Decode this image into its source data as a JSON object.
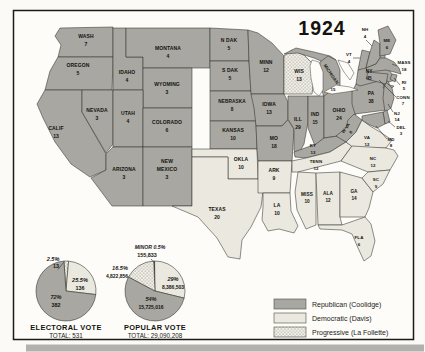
{
  "title": "1924",
  "colors": {
    "republican": "#a8a7a1",
    "democratic": "#eae8df",
    "progressive_bg": "#f3f1e8",
    "dot": "#45443f",
    "minor": "#1c1c1a",
    "frame": "#1b1b19",
    "paper": "#fdfcf9"
  },
  "map": {
    "states": [
      {
        "id": "wash",
        "label": "WASH",
        "votes": "7",
        "party": "republican"
      },
      {
        "id": "oregon",
        "label": "OREGON",
        "votes": "5",
        "party": "republican"
      },
      {
        "id": "calif",
        "label": "CALIF",
        "votes": "13",
        "party": "republican"
      },
      {
        "id": "nevada",
        "label": "NEVADA",
        "votes": "3",
        "party": "republican"
      },
      {
        "id": "idaho",
        "label": "IDAHO",
        "votes": "4",
        "party": "republican"
      },
      {
        "id": "montana",
        "label": "MONTANA",
        "votes": "4",
        "party": "republican"
      },
      {
        "id": "wyoming",
        "label": "WYOMING",
        "votes": "3",
        "party": "republican"
      },
      {
        "id": "utah",
        "label": "UTAH",
        "votes": "4",
        "party": "republican"
      },
      {
        "id": "colorado",
        "label": "COLORADO",
        "votes": "6",
        "party": "republican"
      },
      {
        "id": "arizona",
        "label": "ARIZONA",
        "votes": "3",
        "party": "republican"
      },
      {
        "id": "new-mexico",
        "label": "NEW MEXICO",
        "votes": "3",
        "party": "republican"
      },
      {
        "id": "n-dak",
        "label": "N DAK",
        "votes": "5",
        "party": "republican"
      },
      {
        "id": "s-dak",
        "label": "S DAK",
        "votes": "5",
        "party": "republican"
      },
      {
        "id": "nebraska",
        "label": "NEBRASKA",
        "votes": "8",
        "party": "republican"
      },
      {
        "id": "kansas",
        "label": "KANSAS",
        "votes": "10",
        "party": "republican"
      },
      {
        "id": "okla",
        "label": "OKLA",
        "votes": "10",
        "party": "democratic"
      },
      {
        "id": "texas",
        "label": "TEXAS",
        "votes": "20",
        "party": "democratic"
      },
      {
        "id": "minn",
        "label": "MINN",
        "votes": "12",
        "party": "republican"
      },
      {
        "id": "iowa",
        "label": "IOWA",
        "votes": "13",
        "party": "republican"
      },
      {
        "id": "mo",
        "label": "MO",
        "votes": "18",
        "party": "republican"
      },
      {
        "id": "ark",
        "label": "ARK",
        "votes": "9",
        "party": "democratic"
      },
      {
        "id": "la",
        "label": "LA",
        "votes": "10",
        "party": "democratic"
      },
      {
        "id": "wis",
        "label": "WIS",
        "votes": "13",
        "party": "progressive"
      },
      {
        "id": "michigan",
        "label": "MICHIGAN",
        "votes": "15",
        "party": "republican"
      },
      {
        "id": "ill",
        "label": "ILL",
        "votes": "29",
        "party": "republican"
      },
      {
        "id": "ind",
        "label": "IND",
        "votes": "15",
        "party": "republican"
      },
      {
        "id": "ohio",
        "label": "OHIO",
        "votes": "24",
        "party": "republican"
      },
      {
        "id": "ky",
        "label": "KY",
        "votes": "13",
        "party": "republican"
      },
      {
        "id": "tenn",
        "label": "TENN",
        "votes": "12",
        "party": "democratic"
      },
      {
        "id": "miss",
        "label": "MISS",
        "votes": "10",
        "party": "democratic"
      },
      {
        "id": "ala",
        "label": "ALA",
        "votes": "12",
        "party": "democratic"
      },
      {
        "id": "ga",
        "label": "GA",
        "votes": "14",
        "party": "democratic"
      },
      {
        "id": "fla",
        "label": "FLA",
        "votes": "6",
        "party": "democratic"
      },
      {
        "id": "w-va",
        "label": "W VA",
        "votes": "8",
        "party": "republican"
      },
      {
        "id": "va",
        "label": "VA",
        "votes": "12",
        "party": "democratic"
      },
      {
        "id": "nc",
        "label": "NC",
        "votes": "12",
        "party": "democratic"
      },
      {
        "id": "sc",
        "label": "SC",
        "votes": "9",
        "party": "democratic"
      },
      {
        "id": "pa",
        "label": "PA",
        "votes": "38",
        "party": "republican"
      },
      {
        "id": "ny",
        "label": "NY",
        "votes": "45",
        "party": "republican"
      },
      {
        "id": "nj",
        "label": "NJ",
        "votes": "14",
        "party": "republican"
      },
      {
        "id": "del",
        "label": "DEL",
        "votes": "3",
        "party": "republican"
      },
      {
        "id": "md",
        "label": "MD",
        "votes": "8",
        "party": "republican"
      },
      {
        "id": "vt",
        "label": "VT",
        "votes": "4",
        "party": "republican"
      },
      {
        "id": "nh",
        "label": "NH",
        "votes": "4",
        "party": "republican"
      },
      {
        "id": "me",
        "label": "ME",
        "votes": "6",
        "party": "republican"
      },
      {
        "id": "mass",
        "label": "MASS",
        "votes": "18",
        "party": "republican"
      },
      {
        "id": "ri",
        "label": "RI",
        "votes": "5",
        "party": "republican"
      },
      {
        "id": "conn",
        "label": "CONN",
        "votes": "7",
        "party": "republican"
      }
    ]
  },
  "legend": {
    "items": [
      {
        "party": "republican",
        "label": "Republican (Coolidge)"
      },
      {
        "party": "democratic",
        "label": "Democratic (Davis)"
      },
      {
        "party": "progressive",
        "label": "Progressive (La Follette)"
      }
    ]
  },
  "chart_data": [
    {
      "type": "pie",
      "name": "electoral-vote",
      "title": "ELECTORAL VOTE",
      "subtitle": "TOTAL: 531",
      "total": 531,
      "slices": [
        {
          "party": "progressive",
          "label": "2.5%",
          "value": 2.5,
          "value_label": "13"
        },
        {
          "party": "democratic",
          "label": "25.5%",
          "value": 25.5,
          "value_label": "136"
        },
        {
          "party": "republican",
          "label": "72%",
          "value": 72,
          "value_label": "382"
        }
      ]
    },
    {
      "type": "pie",
      "name": "popular-vote",
      "title": "POPULAR VOTE",
      "subtitle": "TOTAL: 29,090,208",
      "total": 29090208,
      "slices": [
        {
          "party": "minor",
          "label": "MINOR 0.5%",
          "value": 0.5,
          "value_label": "155,833"
        },
        {
          "party": "democratic",
          "label": "29%",
          "value": 29,
          "value_label": "8,386,503"
        },
        {
          "party": "republican",
          "label": "54%",
          "value": 54,
          "value_label": "15,725,016"
        },
        {
          "party": "progressive",
          "label": "16.5%",
          "value": 16.5,
          "value_label": "4,822,856"
        }
      ]
    }
  ]
}
